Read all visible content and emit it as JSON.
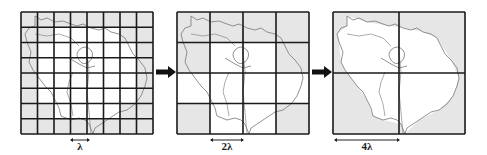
{
  "figure": {
    "colors": {
      "grid_line": "#1a1a1a",
      "cell_fill_outside": "#e6e6e6",
      "cell_fill_inside": "#ffffff",
      "boundary_line": "#777777",
      "arrow": "#111111"
    },
    "panels": [
      {
        "id": "fine",
        "grid_size": 8,
        "scale_label": "λ",
        "scale_cells": 1
      },
      {
        "id": "medium",
        "grid_size": 4,
        "scale_label": "2λ",
        "scale_cells": 1
      },
      {
        "id": "coarse",
        "grid_size": 2,
        "scale_label": "4λ",
        "scale_cells": 1
      }
    ],
    "arrows": [
      {
        "from": "fine",
        "to": "medium"
      },
      {
        "from": "medium",
        "to": "coarse"
      }
    ]
  }
}
